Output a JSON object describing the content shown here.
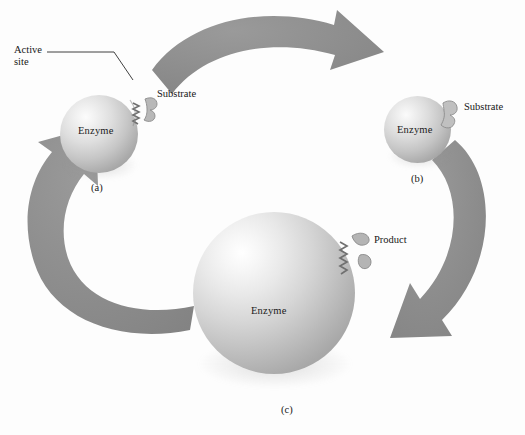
{
  "figure": {
    "kind": "enzyme-catalysis-cycle-diagram",
    "background_color": "#fdfdfd",
    "arrow_color": "#8a8a8a",
    "text_color": "#171717",
    "sphere_light_color": "#ffffff",
    "sphere_dark_color": "#979797"
  },
  "labels": {
    "active_site_line1": "Active",
    "active_site_line2": "site",
    "substrate_a": "Substrate",
    "substrate_b": "Substrate",
    "product": "Product"
  },
  "panels": [
    {
      "id": "a",
      "letter": "(a)",
      "enzyme_label": "Enzyme"
    },
    {
      "id": "b",
      "letter": "(b)",
      "enzyme_label": "Enzyme"
    },
    {
      "id": "c",
      "letter": "(c)",
      "enzyme_label": "Enzyme"
    }
  ],
  "arrows": [
    {
      "name": "arrow-a-to-b",
      "from": "a",
      "to": "b",
      "position": "top"
    },
    {
      "name": "arrow-b-to-c",
      "from": "b",
      "to": "c",
      "position": "right"
    },
    {
      "name": "arrow-c-to-a",
      "from": "c",
      "to": "a",
      "position": "bottom-left"
    }
  ]
}
